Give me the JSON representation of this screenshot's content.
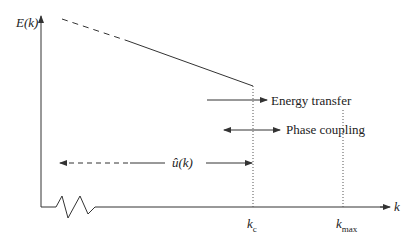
{
  "diagram": {
    "y_axis_label": "E(k)",
    "x_axis_label": "k",
    "ticks": [
      {
        "label": "k",
        "sub": "c"
      },
      {
        "label": "k",
        "sub": "max"
      }
    ],
    "annotations": {
      "energy_transfer": "Energy transfer",
      "phase_coupling": "Phase coupling",
      "u_hat": "û(k)"
    },
    "line_color": "#333333"
  }
}
